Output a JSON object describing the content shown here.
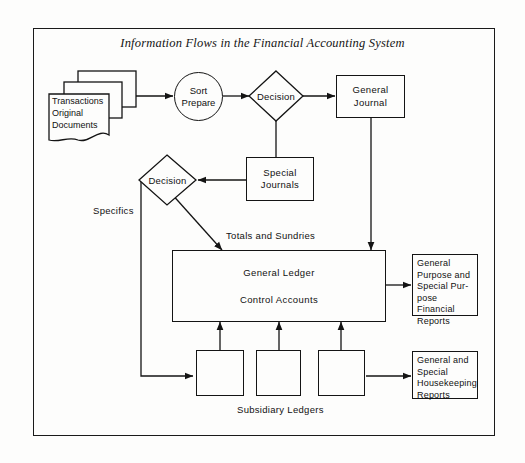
{
  "diagram": {
    "title": "Information Flows in the Financial Accounting System",
    "nodes": {
      "transactions": "Transactions\nOriginal\nDocuments",
      "sort_prepare": "Sort\nPrepare",
      "decision_one": "Decision",
      "general_journal": "General\nJournal",
      "special_journals": "Special\nJournals",
      "decision_two": "Decision",
      "general_ledger_line1": "General Ledger",
      "general_ledger_line2": "Control Accounts",
      "financial_reports": "General\nPurpose and\nSpecial Pur-\npose Financial\nReports",
      "housekeeping_reports": "General and\nSpecial\nHousekeeping\nReports",
      "subsidiary_ledger_1": "",
      "subsidiary_ledger_2": "",
      "subsidiary_ledger_3": ""
    },
    "edge_labels": {
      "specifics": "Specifics",
      "totals_and_sundries": "Totals and Sundries",
      "subsidiary_ledgers": "Subsidiary Ledgers"
    },
    "colors": {
      "stroke": "#141414",
      "background": "#fdfdfc",
      "text": "#111111"
    }
  }
}
